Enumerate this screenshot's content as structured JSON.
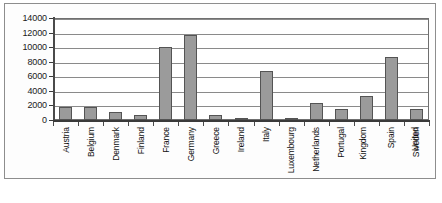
{
  "chart_data": {
    "type": "bar",
    "title": "",
    "xlabel": "",
    "ylabel": "",
    "ylim": [
      0,
      14000
    ],
    "ytick_step": 2000,
    "yticks": [
      "14000",
      "12000",
      "10000",
      "8000",
      "6000",
      "4000",
      "2000",
      "0"
    ],
    "grid": true,
    "legend": false,
    "bar_color": "#9b9b9b",
    "bar_border_color": "#545454",
    "categories": [
      "Austria",
      "Belgium",
      "Denmark",
      "Finland",
      "France",
      "Germany",
      "Greece",
      "Ireland",
      "Italy",
      "Luxembourg",
      "Netherlands",
      "Portugal",
      "United Kingdom",
      "Spain",
      "Sweden"
    ],
    "category_labels": [
      {
        "line1": "Austria",
        "line2": ""
      },
      {
        "line1": "Belgium",
        "line2": ""
      },
      {
        "line1": "Denmark",
        "line2": ""
      },
      {
        "line1": "Finland",
        "line2": ""
      },
      {
        "line1": "France",
        "line2": ""
      },
      {
        "line1": "Germany",
        "line2": ""
      },
      {
        "line1": "Greece",
        "line2": ""
      },
      {
        "line1": "Ireland",
        "line2": ""
      },
      {
        "line1": "Italy",
        "line2": ""
      },
      {
        "line1": "Luxembourg",
        "line2": ""
      },
      {
        "line1": "Netherlands",
        "line2": ""
      },
      {
        "line1": "Portugal",
        "line2": ""
      },
      {
        "line1": "Kingdom",
        "line2": "United"
      },
      {
        "line1": "Spain",
        "line2": ""
      },
      {
        "line1": "Sweden",
        "line2": ""
      }
    ],
    "values": [
      1800,
      1800,
      1100,
      700,
      10000,
      11700,
      700,
      250,
      6700,
      120,
      2400,
      1500,
      3300,
      8700,
      1500
    ]
  }
}
